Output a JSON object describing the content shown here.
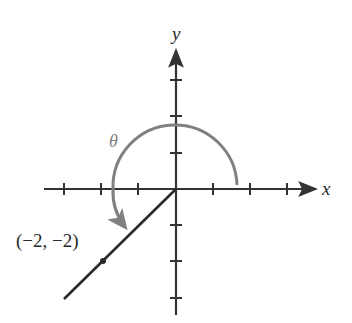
{
  "figure": {
    "axes": {
      "x_label": "x",
      "y_label": "y",
      "origin_px": [
        175,
        189
      ],
      "unit_px": 37,
      "x_ticks": [
        -3,
        -2,
        -1,
        1,
        2,
        3
      ],
      "y_ticks": [
        3,
        2,
        1,
        -1,
        -2,
        -3
      ]
    },
    "angle": {
      "label": "θ",
      "color": "#808080",
      "direction": "counterclockwise",
      "from": "positive x-axis",
      "to": "terminal ray through (-2, -2)"
    },
    "terminal_ray": {
      "color": "#2a2a2a",
      "point": {
        "x": -2,
        "y": -2
      },
      "point_label": "(−2, −2)"
    },
    "colors": {
      "axis": "#333333",
      "arc": "#808080",
      "text": "#2a2a2a",
      "background": "#ffffff"
    }
  }
}
